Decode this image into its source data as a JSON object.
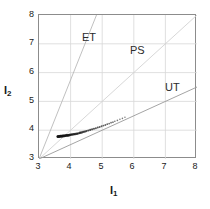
{
  "chart_data": {
    "type": "scatter",
    "title": "",
    "xlabel": "I1",
    "ylabel": "I2",
    "xlim": [
      3,
      8
    ],
    "ylim": [
      3,
      8
    ],
    "xticks": [
      3,
      4,
      5,
      6,
      7,
      8
    ],
    "yticks": [
      3,
      4,
      5,
      6,
      7,
      8
    ],
    "xticklabels": [
      "3",
      "4",
      "5",
      "6",
      "7",
      "8"
    ],
    "yticklabels": [
      "3",
      "4",
      "5",
      "6",
      "7",
      "8"
    ],
    "grid": true,
    "grid_color": "#d8d8d8",
    "legend": "none",
    "frame_color": "#8c8c8c",
    "annotations": [
      {
        "text": "ET",
        "x": 4.45,
        "y": 7.35
      },
      {
        "text": "PS",
        "x": 5.95,
        "y": 6.9
      },
      {
        "text": "UT",
        "x": 7.05,
        "y": 5.6
      }
    ],
    "series": [
      {
        "name": "ET-PS boundary",
        "type": "line",
        "color": "#b9b9b9",
        "x": [
          3.0,
          4.82
        ],
        "y": [
          3.0,
          8.0
        ],
        "comment": "steep ray from origin (3,3), slope 2.75"
      },
      {
        "name": "PS-UT boundary",
        "type": "line",
        "color": "#d2d2d2",
        "x": [
          3.0,
          8.0
        ],
        "y": [
          3.0,
          8.0
        ],
        "comment": "unit-slope diagonal ray from (3,3)"
      },
      {
        "name": "UT lower boundary",
        "type": "line",
        "color": "#9a9a9a",
        "x": [
          3.0,
          8.0
        ],
        "y": [
          3.0,
          5.5
        ],
        "comment": "shallow ray from origin (3,3), slope 0.50"
      },
      {
        "name": "data points",
        "type": "scatter",
        "color": "#141414",
        "marker": "dot",
        "x": [
          3.6,
          3.64,
          3.68,
          3.72,
          3.76,
          3.8,
          3.84,
          3.88,
          3.92,
          3.96,
          4.0,
          4.05,
          4.1,
          4.15,
          4.2,
          4.25,
          4.3,
          4.35,
          4.4,
          4.45,
          4.5,
          4.56,
          4.62,
          4.68,
          4.74,
          4.8,
          4.86,
          4.92,
          4.98,
          5.04,
          5.1,
          5.16,
          5.22,
          5.28,
          5.34,
          5.4,
          5.48,
          5.56,
          5.64,
          5.72
        ],
        "y": [
          3.78,
          3.78,
          3.79,
          3.79,
          3.8,
          3.8,
          3.81,
          3.82,
          3.82,
          3.83,
          3.84,
          3.85,
          3.86,
          3.87,
          3.88,
          3.89,
          3.91,
          3.92,
          3.94,
          3.95,
          3.97,
          3.99,
          4.01,
          4.03,
          4.05,
          4.07,
          4.09,
          4.11,
          4.14,
          4.16,
          4.18,
          4.21,
          4.23,
          4.26,
          4.28,
          4.31,
          4.34,
          4.38,
          4.41,
          4.45
        ]
      }
    ]
  }
}
